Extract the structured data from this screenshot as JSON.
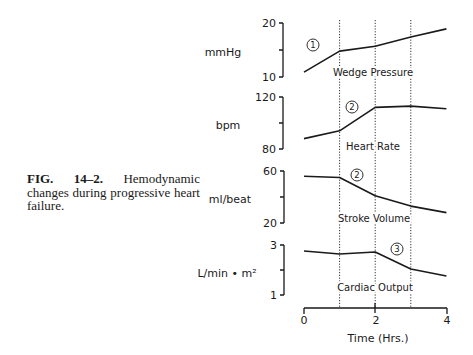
{
  "caption": {
    "label": "FIG. 14–2.",
    "text": "Hemodynamic changes during progressive heart failure."
  },
  "x_axis": {
    "label": "Time (Hrs.)",
    "ticks": [
      "0",
      "2",
      "4"
    ],
    "reference_lines_at": [
      1,
      2,
      3
    ]
  },
  "chart_data": [
    {
      "type": "line",
      "title": "Wedge Pressure",
      "ylabel": "mmHg",
      "ylim": [
        10,
        20
      ],
      "yticks": [
        "20",
        "10"
      ],
      "x": [
        0,
        1,
        2,
        3,
        4
      ],
      "values": [
        10.9,
        14.8,
        15.7,
        17.4,
        18.9
      ],
      "annotation": "1",
      "xlabel": ""
    },
    {
      "type": "line",
      "title": "Heart Rate",
      "ylabel": "bpm",
      "ylim": [
        80,
        120
      ],
      "yticks": [
        "120",
        "80"
      ],
      "x": [
        0,
        1,
        2,
        3,
        4
      ],
      "values": [
        88,
        94,
        112,
        113,
        111
      ],
      "annotation": "2",
      "xlabel": ""
    },
    {
      "type": "line",
      "title": "Stroke Volume",
      "ylabel": "ml/beat",
      "ylim": [
        20,
        60
      ],
      "yticks": [
        "60",
        "20"
      ],
      "x": [
        0,
        1,
        2,
        3,
        4
      ],
      "values": [
        56,
        55,
        41,
        33,
        28
      ],
      "annotation": "2",
      "xlabel": ""
    },
    {
      "type": "line",
      "title": "Cardiac Output",
      "ylabel": "L/min • m²",
      "ylim": [
        1,
        3
      ],
      "yticks": [
        "3",
        "1"
      ],
      "x": [
        0,
        1,
        2,
        3,
        4
      ],
      "values": [
        2.76,
        2.64,
        2.72,
        2.04,
        1.76
      ],
      "annotation": "3",
      "xlabel": "Time (Hrs.)",
      "xlim": [
        0,
        4
      ],
      "grid": false
    }
  ]
}
